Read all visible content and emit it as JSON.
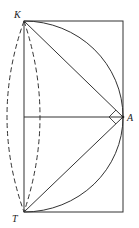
{
  "diagram": {
    "labels": {
      "K": "K",
      "A": "A",
      "T": "T"
    },
    "points": {
      "K": [
        24,
        21
      ],
      "A": [
        123,
        117
      ],
      "T": [
        24,
        212
      ]
    },
    "elements": [
      "rectangle",
      "segment K-A",
      "segment T-A",
      "segment center-A (horizontal)",
      "arc K-A",
      "arc A-T",
      "dashed outer ellipse arc K-T",
      "dashed inner ellipse arc K-T",
      "right-angle marker at A"
    ],
    "colors": {
      "stroke": "#333333",
      "background": "#ffffff"
    }
  }
}
